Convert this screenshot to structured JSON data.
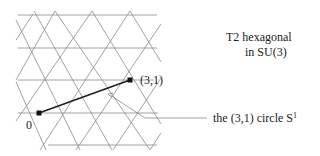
{
  "diagram": {
    "title_line1": "T2 hexagonal",
    "title_line2": "in SU(3)",
    "origin_label": "0",
    "point_label": "(3,1)",
    "circle_label": "the (3,1) circle S",
    "circle_label_sup": "1",
    "colors": {
      "grid": "#8a8a8a",
      "vector": "#222222",
      "leader": "#8a8a8a"
    },
    "lattice": {
      "rows_y": [
        15,
        48,
        80,
        113,
        145
      ],
      "spacing_x": 37,
      "origin": [
        39,
        113
      ],
      "point_3_1": [
        130,
        80
      ]
    }
  }
}
